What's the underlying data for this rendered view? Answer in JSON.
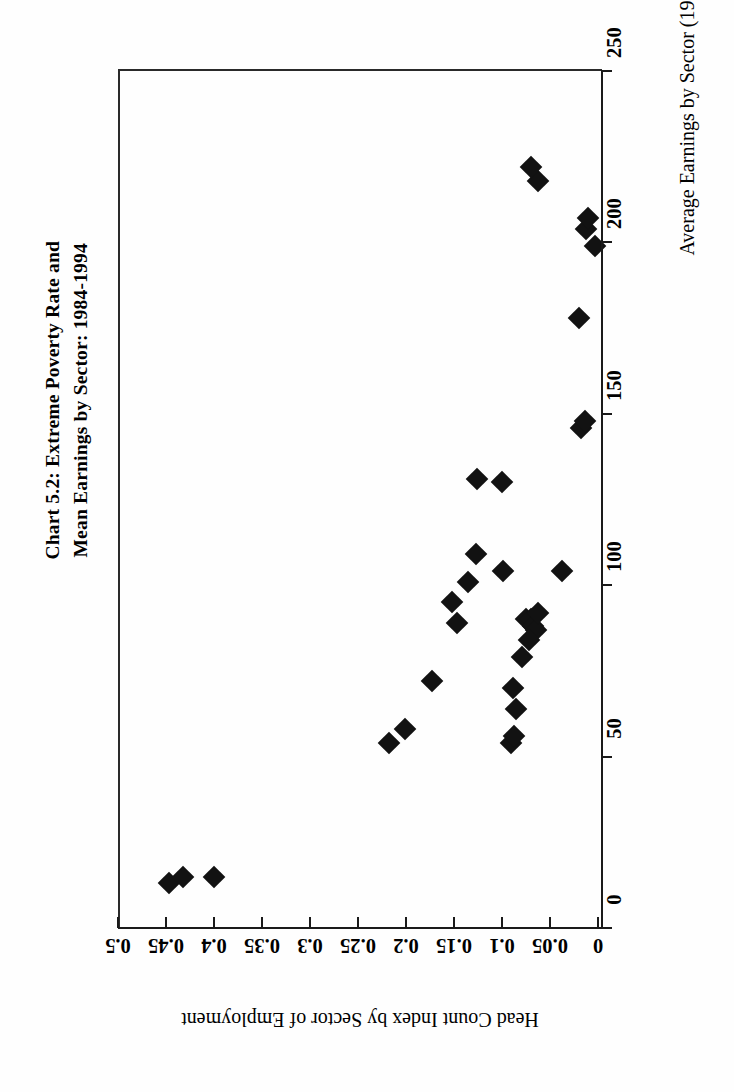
{
  "title": "Chart 5.2:  Extreme Poverty Rate and\nMean Earnings by Sector: 1984-1994",
  "xaxis": {
    "label": "Average Earnings by Sector (1980 pesos)",
    "ticks": [
      "0",
      "50",
      "100",
      "150",
      "200",
      "250"
    ],
    "min": 0,
    "max": 250
  },
  "yaxis": {
    "label": "Head Count Index by Sector of Employment",
    "ticks": [
      "0",
      "0.05",
      "0.1",
      "0.15",
      "0.2",
      "0.25",
      "0.3",
      "0.35",
      "0.4",
      "0.45",
      "0.5"
    ],
    "min": 0,
    "max": 0.5
  },
  "colors": {
    "marker": "#121212",
    "axis": "#1a1a1a",
    "frame": "#2a2a2a",
    "background": "#ffffff"
  },
  "chart_data": {
    "type": "scatter",
    "title": "Chart 5.2:  Extreme Poverty Rate and Mean Earnings by Sector: 1984-1994",
    "xlabel": "Average Earnings by Sector (1980 pesos)",
    "ylabel": "Head Count Index by Sector of Employment",
    "xlim": [
      0,
      250
    ],
    "ylim": [
      0,
      0.5
    ],
    "xticks": [
      0,
      50,
      100,
      150,
      200,
      250
    ],
    "yticks": [
      0,
      0.05,
      0.1,
      0.15,
      0.2,
      0.25,
      0.3,
      0.35,
      0.4,
      0.45,
      0.5
    ],
    "grid": false,
    "legend": null,
    "marker": "diamond",
    "series": [
      {
        "name": "Sector-year observations",
        "points": [
          {
            "x": 13,
            "y": 0.447
          },
          {
            "x": 15,
            "y": 0.432
          },
          {
            "x": 15,
            "y": 0.4
          },
          {
            "x": 54,
            "y": 0.218
          },
          {
            "x": 58,
            "y": 0.201
          },
          {
            "x": 72,
            "y": 0.173
          },
          {
            "x": 89,
            "y": 0.147
          },
          {
            "x": 95,
            "y": 0.152
          },
          {
            "x": 101,
            "y": 0.135
          },
          {
            "x": 109,
            "y": 0.127
          },
          {
            "x": 131,
            "y": 0.126
          },
          {
            "x": 130,
            "y": 0.1
          },
          {
            "x": 104,
            "y": 0.099
          },
          {
            "x": 90,
            "y": 0.075
          },
          {
            "x": 90,
            "y": 0.07
          },
          {
            "x": 88,
            "y": 0.068
          },
          {
            "x": 87,
            "y": 0.065
          },
          {
            "x": 92,
            "y": 0.063
          },
          {
            "x": 84,
            "y": 0.072
          },
          {
            "x": 79,
            "y": 0.079
          },
          {
            "x": 70,
            "y": 0.089
          },
          {
            "x": 64,
            "y": 0.085
          },
          {
            "x": 54,
            "y": 0.091
          },
          {
            "x": 56,
            "y": 0.088
          },
          {
            "x": 104,
            "y": 0.037
          },
          {
            "x": 146,
            "y": 0.018
          },
          {
            "x": 148,
            "y": 0.014
          },
          {
            "x": 178,
            "y": 0.02
          },
          {
            "x": 199,
            "y": 0.003
          },
          {
            "x": 204,
            "y": 0.013
          },
          {
            "x": 207,
            "y": 0.01
          },
          {
            "x": 218,
            "y": 0.063
          },
          {
            "x": 222,
            "y": 0.07
          }
        ]
      }
    ]
  }
}
